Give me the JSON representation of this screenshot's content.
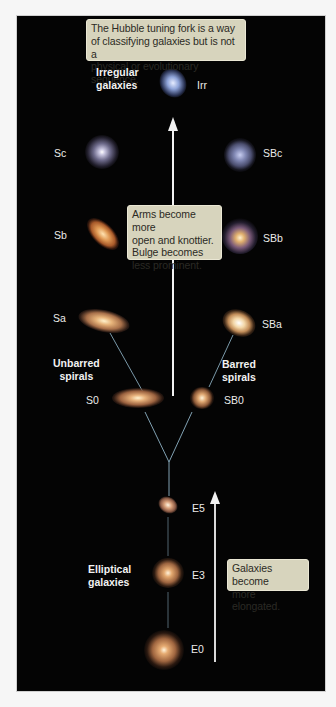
{
  "figure": {
    "title_callout": "The Hubble tuning fork is a way of classifying galaxies but is not a physical or evolutionary sequence.",
    "title_callout_lines": [
      "The Hubble tuning fork is a way",
      "of classifying galaxies but is not a",
      "physical or evolutionary sequence."
    ],
    "spiral_callout_lines": [
      "Arms become more",
      "open and knottier.",
      "Bulge becomes",
      "less prominent."
    ],
    "elliptical_callout_lines": [
      "Galaxies become",
      "more elongated."
    ],
    "group_labels": {
      "irregular": [
        "Irregular",
        "galaxies"
      ],
      "unbarred": [
        "Unbarred",
        "spirals"
      ],
      "barred": [
        "Barred",
        "spirals"
      ],
      "elliptical": [
        "Elliptical",
        "galaxies"
      ]
    },
    "galaxy_types": {
      "irr": "Irr",
      "sc": "Sc",
      "sb": "Sb",
      "sa": "Sa",
      "s0": "S0",
      "sbc": "SBc",
      "sbb": "SBb",
      "sba": "SBa",
      "sb0": "SB0",
      "e5": "E5",
      "e3": "E3",
      "e0": "E0"
    },
    "colors": {
      "background": "#040404",
      "callout": "#d7d4bd",
      "fork_line": "#8fb3c6",
      "arrow": "#f2f2f2"
    }
  }
}
